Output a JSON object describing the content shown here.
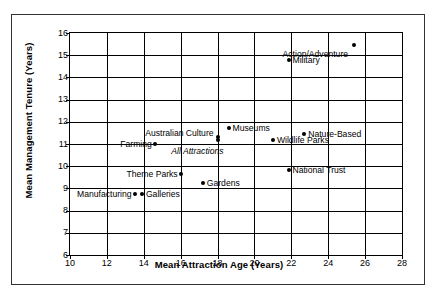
{
  "chart_data": {
    "type": "scatter",
    "title": "",
    "xlabel": "Mean Attraction Age (Years)",
    "ylabel": "Mean Management Tenure (Years)",
    "xlim": [
      10,
      28
    ],
    "ylim": [
      6,
      16
    ],
    "xticks": [
      10,
      12,
      14,
      16,
      18,
      20,
      22,
      24,
      26,
      28
    ],
    "yticks": [
      6,
      7,
      8,
      9,
      10,
      11,
      12,
      13,
      14,
      15,
      16
    ],
    "grid": true,
    "legend": "none",
    "marker_color": "#000000",
    "points": [
      {
        "label": "Action/Adventure",
        "x": 25.4,
        "y": 15.45,
        "label_side": "left",
        "label_dx": -6,
        "label_dy": 9,
        "italic": false
      },
      {
        "label": "Military",
        "x": 21.9,
        "y": 14.8,
        "label_side": "right",
        "label_dx": 3,
        "label_dy": 0,
        "italic": false
      },
      {
        "label": "Museums",
        "x": 18.6,
        "y": 11.7,
        "label_side": "right",
        "label_dx": 4,
        "label_dy": 0,
        "italic": false
      },
      {
        "label": "Nature-Based",
        "x": 22.7,
        "y": 11.45,
        "label_side": "right",
        "label_dx": 4,
        "label_dy": 0,
        "italic": false
      },
      {
        "label": "Australian Culture",
        "x": 18.0,
        "y": 11.3,
        "label_side": "left",
        "label_dx": -4,
        "label_dy": -4,
        "italic": false
      },
      {
        "label": "Wildlife Parks",
        "x": 21.0,
        "y": 11.2,
        "label_side": "right",
        "label_dx": 4,
        "label_dy": 0,
        "italic": false
      },
      {
        "label": "All Attractions",
        "x": 18.0,
        "y": 11.2,
        "label_side": "left",
        "label_dx": 6,
        "label_dy": 11,
        "italic": true
      },
      {
        "label": "Farming",
        "x": 14.6,
        "y": 11.0,
        "label_side": "left",
        "label_dx": -3,
        "label_dy": 0,
        "italic": false
      },
      {
        "label": "National Trust",
        "x": 21.9,
        "y": 9.85,
        "label_side": "right",
        "label_dx": 3,
        "label_dy": 0,
        "italic": false
      },
      {
        "label": "Theme Parks",
        "x": 16.0,
        "y": 9.65,
        "label_side": "left",
        "label_dx": -3,
        "label_dy": 0,
        "italic": false
      },
      {
        "label": "Gardens",
        "x": 17.2,
        "y": 9.25,
        "label_side": "right",
        "label_dx": 4,
        "label_dy": 0,
        "italic": false
      },
      {
        "label": "Manufacturing",
        "x": 13.5,
        "y": 8.75,
        "label_side": "left",
        "label_dx": -3,
        "label_dy": 0,
        "italic": false
      },
      {
        "label": "Galleries",
        "x": 13.9,
        "y": 8.75,
        "label_side": "right",
        "label_dx": 4,
        "label_dy": 0,
        "italic": false
      }
    ]
  }
}
